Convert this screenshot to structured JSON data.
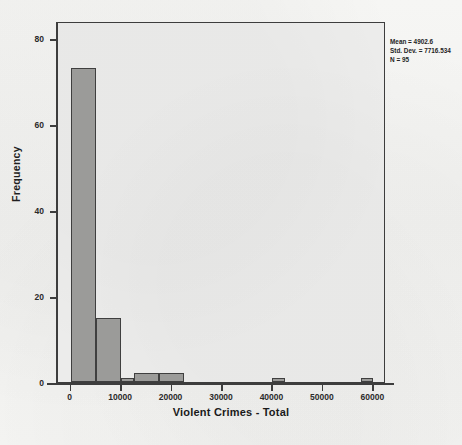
{
  "chart_data": {
    "type": "bar",
    "title": "",
    "subtitle": "",
    "xlabel": "Violent Crimes - Total",
    "ylabel": "Frequency",
    "xlim": [
      -2500,
      62500
    ],
    "ylim": [
      0,
      84
    ],
    "grid": false,
    "legend": null,
    "bin_width": 2500,
    "x_ticks": [
      0,
      10000,
      20000,
      30000,
      40000,
      50000,
      60000
    ],
    "x_tick_labels": [
      "0",
      "10000",
      "20000",
      "30000",
      "40000",
      "50000",
      "60000"
    ],
    "y_ticks": [
      0,
      20,
      40,
      60,
      80
    ],
    "y_tick_labels": [
      "0",
      "20",
      "40",
      "60",
      "80"
    ],
    "bins": [
      {
        "bin_start": 0,
        "bin_end": 5000,
        "center": 2500,
        "frequency": 73
      },
      {
        "bin_start": 5000,
        "bin_end": 10000,
        "center": 7500,
        "frequency": 15
      },
      {
        "bin_start": 10000,
        "bin_end": 12500,
        "center": 11250,
        "frequency": 1
      },
      {
        "bin_start": 12500,
        "bin_end": 17500,
        "center": 15000,
        "frequency": 2
      },
      {
        "bin_start": 17500,
        "bin_end": 22500,
        "center": 20000,
        "frequency": 2
      },
      {
        "bin_start": 40000,
        "bin_end": 42500,
        "center": 41250,
        "frequency": 1
      },
      {
        "bin_start": 57500,
        "bin_end": 60000,
        "center": 58750,
        "frequency": 1
      }
    ],
    "categories": [
      "2500",
      "7500",
      "11250",
      "15000",
      "20000",
      "41250",
      "58750"
    ],
    "values": [
      73,
      15,
      1,
      2,
      2,
      1,
      1
    ],
    "annotations": {
      "mean_label": "Mean = 4902.6",
      "std_dev_label": "Std. Dev. = 7716.534",
      "n_label": "N = 95",
      "position": "top-right-outside"
    }
  },
  "colors": {
    "bar_fill": "#9b9b99",
    "bar_border": "#3f3f3f",
    "axis": "#3d3d3d",
    "plot_background": "#ececeb",
    "page_background": "#f4f4f2",
    "text": "#1f1f1f"
  }
}
